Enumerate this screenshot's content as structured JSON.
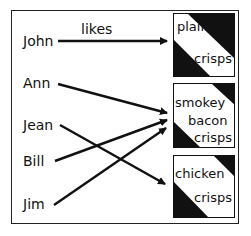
{
  "diagram": {
    "relation_label": "likes",
    "people": [
      {
        "name": "John"
      },
      {
        "name": "Ann"
      },
      {
        "name": "Jean"
      },
      {
        "name": "Bill"
      },
      {
        "name": "Jim"
      }
    ],
    "products": [
      {
        "lines": [
          "plain",
          "crisps"
        ]
      },
      {
        "lines": [
          "smokey",
          "bacon",
          "crisps"
        ]
      },
      {
        "lines": [
          "chicken",
          "crisps"
        ]
      }
    ],
    "mappings": [
      {
        "from": "John",
        "to": "plain crisps"
      },
      {
        "from": "Ann",
        "to": "smokey bacon crisps"
      },
      {
        "from": "Jean",
        "to": "chicken crisps"
      },
      {
        "from": "Bill",
        "to": "smokey bacon crisps"
      },
      {
        "from": "Jim",
        "to": "smokey bacon crisps"
      }
    ],
    "colors": {
      "ink": "#111111",
      "background": "#ffffff"
    }
  }
}
